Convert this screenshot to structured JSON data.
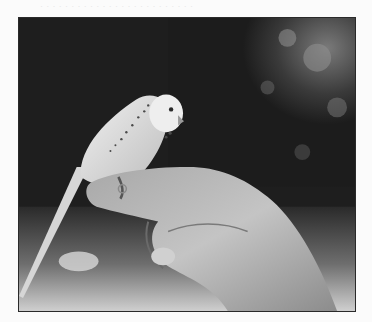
{
  "page": {
    "background_color": "#fbfbfb",
    "bleed_through_text": "·  ·  ·  ·  ·  ·  ·  ·  ·  ·  ·  ·  ·  ·  ·  ·  ·  ·  ·  ·  ·  ·  ·  ·  ·"
  },
  "photo": {
    "subject": "budgerigar perched on a human finger",
    "style": "black-and-white photograph",
    "colors": {
      "background_dark": "#1c1c1c",
      "foliage_light": "#8a8a8a",
      "bird_light": "#e6e6e6",
      "hand_mid": "#b8b8b8",
      "ground_light": "#c8c8c8",
      "frame": "#2a2a2a"
    }
  }
}
